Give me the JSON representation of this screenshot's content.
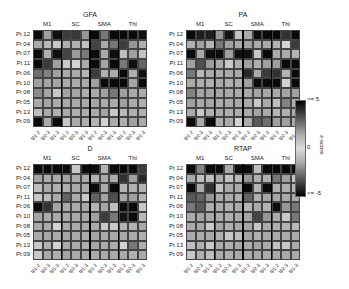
{
  "chart_data": {
    "type": "heatmap",
    "value_encoding": "cell gray level 0-255 (0=black=extreme |z|, ~210=near 0)",
    "rows": [
      "Pt 12",
      "Pt 04",
      "Pt 07",
      "Pt 11",
      "Pt 06",
      "Pt 10",
      "Pt 08",
      "Pt 05",
      "Pt 13",
      "Pt 09"
    ],
    "column_groups": [
      "M1",
      "SC",
      "SMA",
      "Thl"
    ],
    "column_ticks": [
      "tp1-2",
      "tp2-3",
      "tp1-3",
      "tp1-2",
      "tp2-3",
      "tp1-3",
      "tp1-2",
      "tp2-3",
      "tp1-3",
      "tp1-2",
      "tp2-3",
      "tp1-3"
    ],
    "colorbar": {
      "label": "z-score",
      "top": ">= 5",
      "mid": "0",
      "bottom": "<= -5"
    },
    "panels": [
      {
        "title": "GFA",
        "values": [
          [
            10,
            160,
            15,
            60,
            55,
            150,
            10,
            120,
            10,
            10,
            10,
            15
          ],
          [
            170,
            185,
            200,
            175,
            175,
            195,
            70,
            170,
            120,
            60,
            150,
            175
          ],
          [
            10,
            175,
            15,
            70,
            155,
            120,
            10,
            170,
            15,
            190,
            160,
            195
          ],
          [
            10,
            60,
            160,
            200,
            210,
            170,
            10,
            165,
            10,
            120,
            15,
            100
          ],
          [
            110,
            130,
            160,
            170,
            170,
            180,
            60,
            175,
            170,
            10,
            175,
            15
          ],
          [
            160,
            165,
            165,
            170,
            170,
            170,
            160,
            10,
            10,
            10,
            165,
            10
          ],
          [
            140,
            165,
            200,
            165,
            165,
            175,
            170,
            160,
            120,
            160,
            170,
            170
          ],
          [
            170,
            165,
            170,
            170,
            170,
            170,
            165,
            170,
            170,
            160,
            170,
            175
          ],
          [
            190,
            170,
            175,
            170,
            175,
            175,
            170,
            165,
            200,
            185,
            175,
            175
          ],
          [
            10,
            170,
            10,
            200,
            170,
            175,
            180,
            210,
            170,
            175,
            160,
            170
          ]
        ]
      },
      {
        "title": "PA",
        "values": [
          [
            10,
            30,
            30,
            150,
            20,
            195,
            170,
            10,
            10,
            10,
            50,
            10
          ],
          [
            175,
            160,
            180,
            120,
            160,
            170,
            160,
            170,
            170,
            180,
            210,
            60
          ],
          [
            10,
            170,
            15,
            10,
            160,
            15,
            15,
            200,
            10,
            170,
            170,
            180
          ],
          [
            160,
            80,
            155,
            170,
            200,
            175,
            160,
            175,
            160,
            160,
            10,
            10
          ],
          [
            120,
            185,
            170,
            170,
            170,
            170,
            40,
            170,
            60,
            50,
            180,
            10
          ],
          [
            170,
            175,
            175,
            170,
            175,
            175,
            160,
            10,
            10,
            10,
            210,
            10
          ],
          [
            130,
            165,
            165,
            165,
            170,
            170,
            170,
            165,
            165,
            170,
            165,
            160
          ],
          [
            160,
            170,
            165,
            170,
            170,
            170,
            170,
            200,
            170,
            190,
            130,
            175
          ],
          [
            170,
            200,
            175,
            170,
            175,
            175,
            170,
            165,
            170,
            180,
            175,
            170
          ],
          [
            10,
            170,
            10,
            175,
            170,
            210,
            170,
            90,
            110,
            160,
            160,
            170
          ]
        ]
      },
      {
        "title": "D",
        "values": [
          [
            10,
            10,
            10,
            10,
            200,
            10,
            10,
            180,
            10,
            10,
            10,
            60
          ],
          [
            165,
            175,
            170,
            165,
            170,
            170,
            180,
            170,
            170,
            50,
            160,
            40
          ],
          [
            190,
            170,
            175,
            175,
            170,
            170,
            10,
            170,
            10,
            180,
            175,
            180
          ],
          [
            200,
            185,
            170,
            100,
            170,
            200,
            100,
            165,
            80,
            165,
            160,
            180
          ],
          [
            10,
            50,
            165,
            170,
            170,
            170,
            180,
            165,
            190,
            10,
            10,
            200
          ],
          [
            165,
            170,
            170,
            170,
            170,
            170,
            160,
            60,
            120,
            20,
            10,
            185
          ],
          [
            170,
            170,
            210,
            170,
            170,
            170,
            170,
            200,
            200,
            180,
            180,
            170
          ],
          [
            170,
            165,
            170,
            165,
            170,
            170,
            165,
            170,
            170,
            170,
            170,
            175
          ],
          [
            200,
            175,
            210,
            170,
            170,
            175,
            165,
            170,
            170,
            210,
            120,
            175
          ],
          [
            200,
            170,
            175,
            165,
            170,
            170,
            170,
            170,
            170,
            170,
            175,
            170
          ]
        ]
      },
      {
        "title": "RTAP",
        "values": [
          [
            10,
            130,
            10,
            10,
            170,
            10,
            10,
            190,
            10,
            10,
            10,
            10
          ],
          [
            170,
            190,
            190,
            170,
            195,
            185,
            150,
            175,
            175,
            120,
            160,
            195
          ],
          [
            10,
            175,
            50,
            195,
            170,
            170,
            10,
            180,
            10,
            175,
            175,
            180
          ],
          [
            90,
            100,
            150,
            170,
            170,
            175,
            100,
            175,
            165,
            165,
            170,
            170
          ],
          [
            120,
            90,
            175,
            170,
            175,
            170,
            180,
            170,
            180,
            10,
            150,
            120
          ],
          [
            170,
            165,
            170,
            170,
            175,
            170,
            165,
            70,
            150,
            170,
            200,
            120
          ],
          [
            170,
            165,
            200,
            165,
            175,
            170,
            165,
            200,
            170,
            175,
            180,
            185
          ],
          [
            170,
            170,
            170,
            175,
            200,
            190,
            165,
            175,
            170,
            170,
            170,
            170
          ],
          [
            190,
            175,
            200,
            170,
            175,
            170,
            170,
            165,
            170,
            195,
            200,
            170
          ],
          [
            200,
            175,
            190,
            170,
            175,
            170,
            170,
            170,
            170,
            170,
            170,
            170
          ]
        ]
      }
    ]
  }
}
